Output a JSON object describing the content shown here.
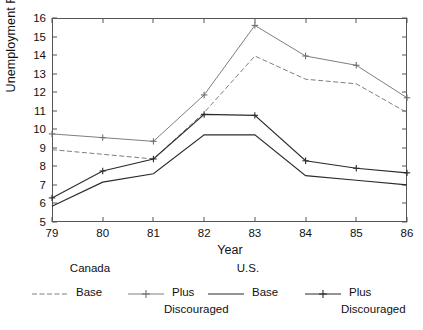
{
  "chart_data": {
    "type": "line",
    "title": "",
    "xlabel": "Year",
    "ylabel": "Unemployment Rate (%)",
    "x": [
      79,
      80,
      81,
      82,
      83,
      84,
      85,
      86
    ],
    "xtick_labels": [
      "79",
      "80",
      "81",
      "82",
      "83",
      "84",
      "85",
      "86"
    ],
    "ytick_labels": [
      "5",
      "6",
      "7",
      "8",
      "9",
      "10",
      "11",
      "12",
      "13",
      "14",
      "15",
      "16"
    ],
    "xlim": [
      79,
      86
    ],
    "ylim": [
      5,
      16
    ],
    "grid": false,
    "legend_position": "bottom",
    "series": [
      {
        "name": "Canada Base",
        "group": "Canada",
        "label": "Base",
        "style": "dash-dot",
        "marker": "none",
        "color": "#6f6f6f",
        "values": [
          8.9,
          8.65,
          8.4,
          10.9,
          13.95,
          12.7,
          12.45,
          10.9
        ]
      },
      {
        "name": "Canada Plus Discouraged",
        "group": "Canada",
        "label": "Plus Discouraged",
        "style": "solid-thin",
        "marker": "plus",
        "color": "#6f6f6f",
        "values": [
          9.75,
          9.55,
          9.35,
          11.85,
          15.6,
          13.95,
          13.45,
          11.7
        ]
      },
      {
        "name": "U.S. Base",
        "group": "U.S.",
        "label": "Base",
        "style": "solid",
        "marker": "none",
        "color": "#2b2b2b",
        "values": [
          5.85,
          7.15,
          7.6,
          9.7,
          9.7,
          7.5,
          7.25,
          7.0
        ]
      },
      {
        "name": "U.S. Plus Discouraged",
        "group": "U.S.",
        "label": "Plus Discouraged",
        "style": "solid",
        "marker": "plus",
        "color": "#2b2b2b",
        "values": [
          6.3,
          7.75,
          8.4,
          10.8,
          10.75,
          8.3,
          7.9,
          7.65
        ]
      }
    ]
  },
  "legend": {
    "groups": [
      {
        "title": "Canada"
      },
      {
        "title": "U.S."
      }
    ],
    "entries": [
      {
        "label": "Base",
        "sub": ""
      },
      {
        "label": "Plus",
        "sub": "Discouraged"
      },
      {
        "label": "Base",
        "sub": ""
      },
      {
        "label": "Plus",
        "sub": "Discouraged"
      }
    ]
  },
  "colors": {
    "canada": "#6f6f6f",
    "us": "#2b2b2b",
    "axis": "#555555",
    "background": "#ffffff"
  }
}
